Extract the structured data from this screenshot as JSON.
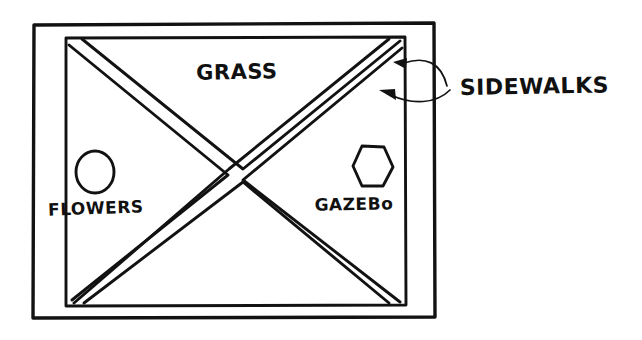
{
  "diagram": {
    "style": "hand-drawn black ink line drawing on white paper",
    "labels": {
      "grass": "GRASS",
      "flowers": "FLOWERS",
      "gazebo": "GAZEBo",
      "sidewalks": "SIDEWALKS"
    },
    "colors": {
      "ink": "#121212",
      "paper": "#ffffff"
    },
    "shapes": {
      "park_boundary": "rectangle",
      "lawn_square": "square",
      "paths": "diagonal X of double-line walkways",
      "flower_bed": "circle",
      "gazebo_footprint": "hexagon"
    },
    "annotations": {
      "sidewalks_arrow_count": 2,
      "sidewalks_arrow_targets": "upper-right diagonal walkway and inner square edge"
    }
  }
}
